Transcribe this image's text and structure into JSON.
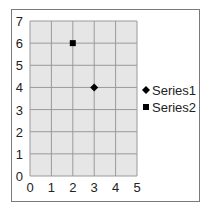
{
  "chart_data": {
    "type": "scatter",
    "title": "",
    "xlabel": "",
    "ylabel": "",
    "xlim": [
      0,
      5
    ],
    "ylim": [
      0,
      7
    ],
    "x_ticks": [
      "0",
      "1",
      "2",
      "3",
      "4",
      "5"
    ],
    "y_ticks": [
      "0",
      "1",
      "2",
      "3",
      "4",
      "5",
      "6",
      "7"
    ],
    "grid": true,
    "legend_position": "right",
    "series": [
      {
        "name": "Series1",
        "marker": "diamond",
        "color": "#000000",
        "points": [
          [
            3,
            4
          ]
        ]
      },
      {
        "name": "Series2",
        "marker": "square",
        "color": "#000000",
        "points": [
          [
            2,
            6
          ]
        ]
      }
    ]
  },
  "colors": {
    "plot_background": "#e6e6e6",
    "gridline": "#9a9a9a",
    "border": "#7a7a7a",
    "marker": "#000000"
  }
}
